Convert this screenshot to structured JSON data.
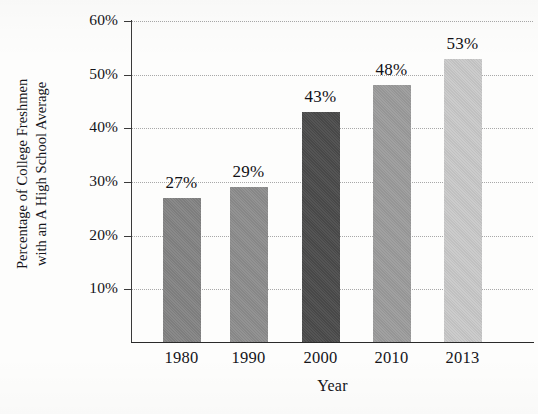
{
  "chart_data": {
    "type": "bar",
    "title": "Percentage of College Freshmen with an A High School Average",
    "title_visible_fragment": "",
    "xlabel": "Year",
    "ylabel_line1": "Percentage of College Freshmen",
    "ylabel_line2": "with an A High School Average",
    "categories": [
      "1980",
      "1990",
      "2000",
      "2010",
      "2013"
    ],
    "values": [
      27,
      29,
      43,
      48,
      53
    ],
    "value_labels": [
      "27%",
      "29%",
      "43%",
      "48%",
      "53%"
    ],
    "ylim": [
      0,
      60
    ],
    "ytick_values": [
      10,
      20,
      30,
      40,
      50,
      60
    ],
    "ytick_labels": [
      "10%",
      "20%",
      "30%",
      "40%",
      "50%",
      "60%"
    ],
    "grid": "horizontal-dotted",
    "legend": "none",
    "bar_colors": [
      "#838383",
      "#8d8d8d",
      "#4b4b4b",
      "#9c9c9c",
      "#c9c9c9"
    ],
    "axis_color": "#2a2a2a",
    "gridline_color": "#9a9a9a",
    "background_color": "#fdfdfc"
  }
}
